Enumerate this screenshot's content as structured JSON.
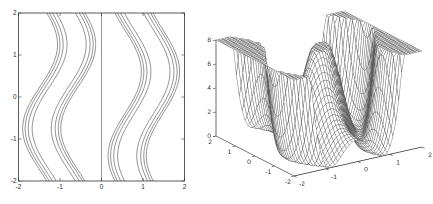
{
  "figure": {
    "background": "#ffffff",
    "panel_count": 2,
    "panels": [
      "contour-plot",
      "surface-mesh-plot"
    ]
  },
  "chart_data": [
    {
      "type": "contour",
      "title": "",
      "xlabel": "",
      "ylabel": "",
      "x_range": [
        -2,
        2
      ],
      "y_range": [
        -2,
        2
      ],
      "x_ticks": [
        "-2",
        "-1",
        "0",
        "1",
        "2"
      ],
      "y_ticks": [
        "-2",
        "-1",
        "0",
        "1",
        "2"
      ],
      "grid": false,
      "box": true,
      "axis_color": "#333333",
      "contour_line_color": "#4a4a4a",
      "center_vertical_line_x": 0,
      "contour_levels": [
        1,
        2,
        3,
        4
      ],
      "contour_radii": [
        0.23,
        0.325,
        0.4,
        0.46
      ],
      "left_well": {
        "center": -1.02,
        "amplitude": 0.42,
        "phase": 0.75
      },
      "right_well": {
        "center": 1.02,
        "amplitude": 0.4,
        "phase": 0.6
      },
      "function": "z = min(8, 4*((x-a(y))*(x-b(y)))^2); a(y) = -1.02 - 0.42*cos(pi*(y+0.75)/2); b(y) = 1.02 + 0.4*cos(pi*(y-0.6)/2)",
      "description": "Two meandering families of nested contour lines around wells near x=-1 and x=+1 (outer lines bunched tighter), plus a straight vertical contour line at x=0; lines wavy in y, left family bulges outward near y=-0.75, right family near y=+0.6"
    },
    {
      "type": "surface",
      "title": "",
      "x_range": [
        -2,
        2
      ],
      "y_range": [
        -2,
        2
      ],
      "z_range": [
        0,
        8
      ],
      "x_ticks": [
        "-2",
        "-1",
        "0",
        "1",
        "2"
      ],
      "y_ticks": [
        "2",
        "1",
        "0",
        "-1",
        "-2"
      ],
      "z_ticks": [
        "0",
        "2",
        "4",
        "6",
        "8"
      ],
      "steepness": 4,
      "grid_divisions": 44,
      "mesh_line_color": "#555555",
      "face_color": "#ffffff",
      "axis_color": "#333333",
      "view": {
        "azimuth": -37.5,
        "elevation": 30
      },
      "left_well": {
        "center": -1.02,
        "amplitude": 0.42,
        "phase": 0.75
      },
      "right_well": {
        "center": 1.02,
        "amplitude": 0.4,
        "phase": 0.6
      },
      "function": "z = min(8, 4*((x-a(y))*(x-b(y)))^2); a(y) = -1.02 - 0.42*cos(pi*(y+0.75)/2); b(y) = 1.02 + 0.4*cos(pi*(y-0.6)/2)",
      "description": "White-faced hidden-line wireframe mesh: flat plateaus clipped at z=8 at outer x, two meandering canyons (z=0) near x=±1, tall rounded central ridge reaching z=8 near mid-y and dropping low at front/back edges"
    }
  ]
}
